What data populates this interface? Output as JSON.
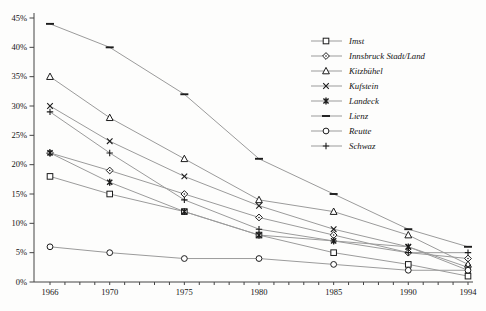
{
  "chart_data": {
    "type": "line",
    "title": "",
    "xlabel": "",
    "ylabel": "",
    "x": [
      1966,
      1970,
      1975,
      1980,
      1985,
      1990,
      1994
    ],
    "x_tick_labels": [
      "1966",
      "1970",
      "1975",
      "1980",
      "1985",
      "1990",
      "1994"
    ],
    "x_range": [
      1966,
      1994
    ],
    "y_tick_labels": [
      "0%",
      "5%",
      "10%",
      "15%",
      "20%",
      "25%",
      "30%",
      "35%",
      "40%",
      "45%"
    ],
    "ylim": [
      0,
      45
    ],
    "y_tick_step": 5,
    "grid": "off",
    "legend_position": "right-inside",
    "line_color": "#9b9b9b",
    "marker_color": "#1c1c1c",
    "text_color": "#141414",
    "axis_color": "#444444",
    "series": [
      {
        "name": "Imst",
        "marker": "square-open",
        "values": [
          18,
          15,
          12,
          8,
          5,
          3,
          1
        ]
      },
      {
        "name": "Innsbruck Stadt/Land",
        "marker": "diamond-open",
        "values": [
          22,
          19,
          15,
          11,
          8,
          5,
          4
        ]
      },
      {
        "name": "Kitzbühel",
        "marker": "triangle-open",
        "values": [
          35,
          28,
          21,
          14,
          12,
          8,
          3
        ]
      },
      {
        "name": "Kufstein",
        "marker": "x",
        "values": [
          30,
          24,
          18,
          13,
          9,
          6,
          2.5
        ]
      },
      {
        "name": "Landeck",
        "marker": "asterisk",
        "values": [
          22,
          17,
          12,
          8,
          7,
          6,
          2
        ]
      },
      {
        "name": "Lienz",
        "marker": "dash",
        "values": [
          44,
          40,
          32,
          21,
          15,
          9,
          6
        ]
      },
      {
        "name": "Reutte",
        "marker": "circle-open",
        "values": [
          6,
          5,
          4,
          4,
          3,
          2,
          2
        ]
      },
      {
        "name": "Schwaz",
        "marker": "plus",
        "values": [
          29,
          22,
          14,
          9,
          7,
          5,
          5
        ]
      }
    ]
  }
}
